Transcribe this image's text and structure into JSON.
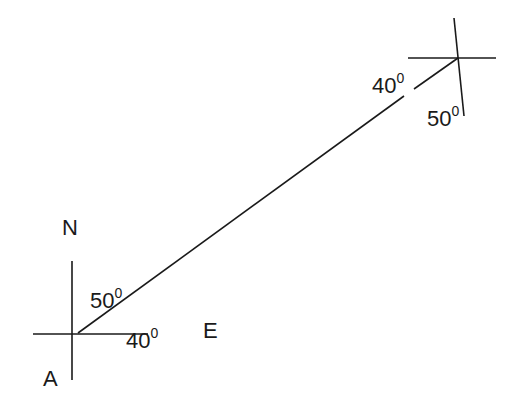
{
  "diagram": {
    "type": "bearing-diagram",
    "line_color": "#1a1a1a",
    "labels": {
      "north": "N",
      "east": "E",
      "point_a": "A",
      "angle_a_north": "50",
      "angle_a_east": "40",
      "angle_b_west": "40",
      "angle_b_south": "50",
      "degree_mark": "0"
    },
    "lines": [
      {
        "name": "a-vertical-axis",
        "x1": 72,
        "y1": 261,
        "x2": 72,
        "y2": 380
      },
      {
        "name": "a-horizontal-axis",
        "x1": 33,
        "y1": 334,
        "x2": 148,
        "y2": 334
      },
      {
        "name": "a-to-b-line-lower",
        "x1": 78,
        "y1": 333,
        "x2": 404,
        "y2": 96
      },
      {
        "name": "a-to-b-line-upper",
        "x1": 414,
        "y1": 89,
        "x2": 458,
        "y2": 58
      },
      {
        "name": "b-horizontal-axis",
        "x1": 408,
        "y1": 58,
        "x2": 496,
        "y2": 58
      },
      {
        "name": "b-vertical-axis",
        "x1": 454,
        "y1": 18,
        "x2": 464,
        "y2": 116
      }
    ]
  }
}
